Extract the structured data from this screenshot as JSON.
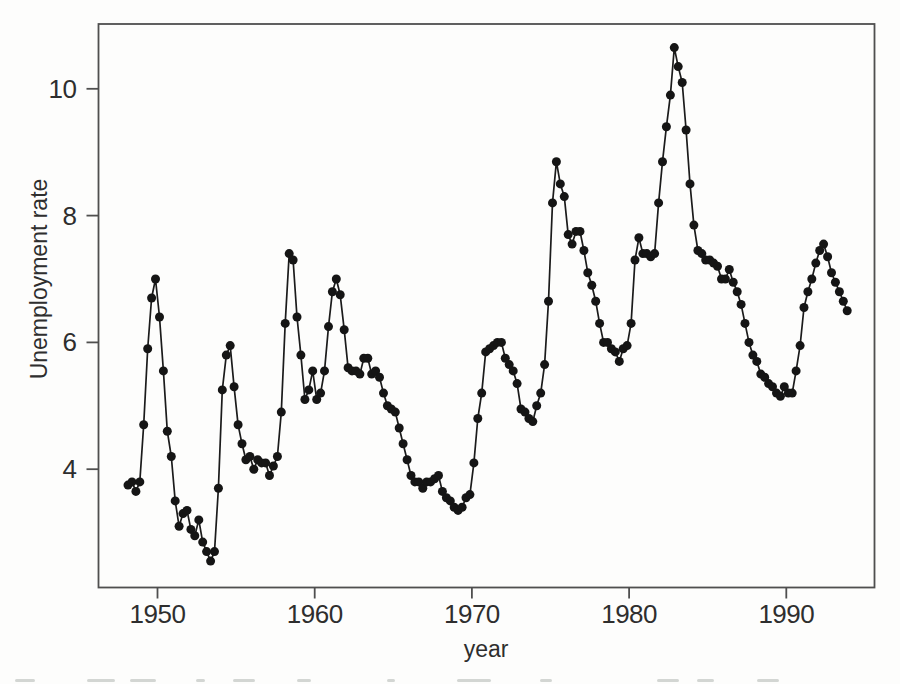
{
  "colors": {
    "line": "#1b1b1b",
    "marker": "#151515",
    "frame": "#4f4f4f",
    "tick": "#4f4f4f",
    "text": "#2e2e2e",
    "background": "#fdfdfc",
    "caption_remnant": "#c4c8c6"
  },
  "chart_data": {
    "type": "line",
    "title": "",
    "xlabel": "year",
    "ylabel": "Unemployment rate",
    "series_name": "quarterly unemployment rate",
    "marker": "filled-circle",
    "grid": false,
    "legend": "none",
    "x_start_year": 1948,
    "x_offset_years": 0.125,
    "x_step_years": 0.25,
    "x_ticks": [
      1950,
      1960,
      1970,
      1980,
      1990
    ],
    "y_ticks": [
      4,
      6,
      8,
      10
    ],
    "xlim": [
      1946.3,
      1995.8
    ],
    "ylim": [
      2.2,
      11.0
    ],
    "values": [
      3.75,
      3.8,
      3.65,
      3.8,
      4.7,
      5.9,
      6.7,
      7.0,
      6.4,
      5.55,
      4.6,
      4.2,
      3.5,
      3.1,
      3.3,
      3.35,
      3.05,
      2.95,
      3.2,
      2.85,
      2.7,
      2.55,
      2.7,
      3.7,
      5.25,
      5.8,
      5.95,
      5.3,
      4.7,
      4.4,
      4.15,
      4.2,
      4.0,
      4.15,
      4.1,
      4.1,
      3.9,
      4.05,
      4.2,
      4.9,
      6.3,
      7.4,
      7.3,
      6.4,
      5.8,
      5.1,
      5.25,
      5.55,
      5.1,
      5.2,
      5.55,
      6.25,
      6.8,
      7.0,
      6.75,
      6.2,
      5.6,
      5.55,
      5.55,
      5.5,
      5.75,
      5.75,
      5.5,
      5.55,
      5.45,
      5.2,
      5.0,
      4.95,
      4.9,
      4.65,
      4.4,
      4.15,
      3.9,
      3.8,
      3.8,
      3.7,
      3.8,
      3.8,
      3.85,
      3.9,
      3.65,
      3.55,
      3.5,
      3.4,
      3.35,
      3.4,
      3.55,
      3.6,
      4.1,
      4.8,
      5.2,
      5.85,
      5.9,
      5.95,
      6.0,
      6.0,
      5.75,
      5.65,
      5.55,
      5.35,
      4.95,
      4.9,
      4.8,
      4.75,
      5.0,
      5.2,
      5.65,
      6.65,
      8.2,
      8.85,
      8.5,
      8.3,
      7.7,
      7.55,
      7.75,
      7.75,
      7.45,
      7.1,
      6.9,
      6.65,
      6.3,
      6.0,
      6.0,
      5.9,
      5.85,
      5.7,
      5.9,
      5.95,
      6.3,
      7.3,
      7.65,
      7.4,
      7.4,
      7.35,
      7.4,
      8.2,
      8.85,
      9.4,
      9.9,
      10.65,
      10.35,
      10.1,
      9.35,
      8.5,
      7.85,
      7.45,
      7.4,
      7.3,
      7.3,
      7.25,
      7.2,
      7.0,
      7.0,
      7.15,
      6.95,
      6.8,
      6.6,
      6.3,
      6.0,
      5.8,
      5.7,
      5.5,
      5.45,
      5.35,
      5.3,
      5.2,
      5.15,
      5.3,
      5.2,
      5.2,
      5.55,
      5.95,
      6.55,
      6.8,
      7.0,
      7.25,
      7.45,
      7.55,
      7.35,
      7.1,
      6.95,
      6.8,
      6.65,
      6.5
    ]
  },
  "caption_remnant_fragments": [
    {
      "x": 15,
      "w": 20
    },
    {
      "x": 87,
      "w": 28
    },
    {
      "x": 130,
      "w": 26
    },
    {
      "x": 196,
      "w": 9
    },
    {
      "x": 233,
      "w": 22
    },
    {
      "x": 297,
      "w": 14
    },
    {
      "x": 387,
      "w": 8
    },
    {
      "x": 457,
      "w": 34
    },
    {
      "x": 540,
      "w": 12
    },
    {
      "x": 657,
      "w": 22
    },
    {
      "x": 697,
      "w": 17
    },
    {
      "x": 757,
      "w": 22
    }
  ]
}
